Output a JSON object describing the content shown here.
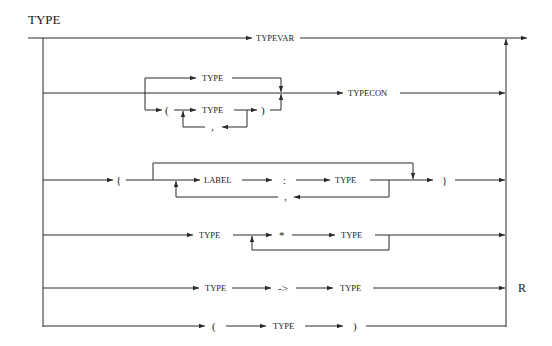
{
  "diagram": {
    "title": "TYPE",
    "side_label": "R",
    "rows": {
      "typevar": {
        "token": "TYPEVAR"
      },
      "typecon": {
        "single_type": "TYPE",
        "open_paren": "(",
        "inner_type": "TYPE",
        "close_paren": ")",
        "separator": ",",
        "token": "TYPECON"
      },
      "record": {
        "open_brace": "{",
        "label": "LABEL",
        "colon": ":",
        "type": "TYPE",
        "separator": ",",
        "close_brace": "}"
      },
      "tuple": {
        "left_type": "TYPE",
        "star": "*",
        "right_type": "TYPE"
      },
      "function": {
        "left_type": "TYPE",
        "arrow": "->",
        "right_type": "TYPE"
      },
      "paren": {
        "open_paren": "(",
        "type": "TYPE",
        "close_paren": ")"
      }
    }
  }
}
